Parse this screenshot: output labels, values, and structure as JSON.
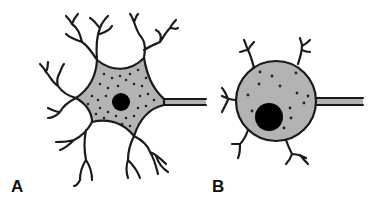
{
  "figure": {
    "panels": [
      {
        "id": "A",
        "label": "A",
        "description": "Multipolar neuron with stellate, granular soma, central nucleus, branching dendrites and an axon"
      },
      {
        "id": "B",
        "label": "B",
        "description": "Neuron with round soma, few short dendrites, eccentric large nucleus and an axon"
      }
    ],
    "colors": {
      "outline": "#1a1a1a",
      "soma_fill": "#b3b3b3",
      "nucleus": "#000000",
      "background": "#ffffff"
    }
  }
}
